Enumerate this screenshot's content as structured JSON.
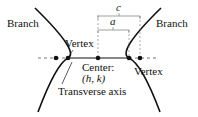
{
  "diagram": {
    "type": "hyperbola",
    "labels": {
      "branch_left": "Branch",
      "branch_right": "Branch",
      "vertex_left": "Vertex",
      "vertex_right": "Vertex",
      "center_line1": "Center:",
      "center_line2": "(h, k)",
      "transverse_axis": "Transverse axis",
      "c": "c",
      "a": "a"
    },
    "colors": {
      "stroke": "#111111",
      "background": "#ffffff",
      "dashed": "#888888"
    }
  }
}
